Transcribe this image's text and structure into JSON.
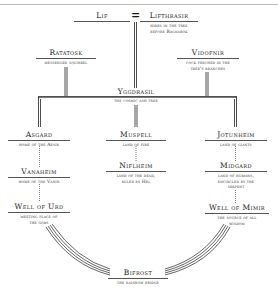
{
  "header": {
    "corner_text": "YGGDRASIL"
  },
  "diagram": {
    "top_pair": {
      "left": {
        "title": "Lif"
      },
      "connector": "=",
      "right": {
        "title": "Lifthrasir",
        "caption": [
          "hides in the tree",
          "before Ragnarok"
        ]
      }
    },
    "ratatosk": {
      "title": "Ratatosk",
      "caption": [
        "messenger squirrel"
      ]
    },
    "vidofnir": {
      "title": "Vidofnir",
      "caption": [
        "cock perched in the",
        "tree's branches"
      ]
    },
    "yggdrasil": {
      "title": "Yggdrasil",
      "caption": [
        "the cosmic ash tree"
      ]
    },
    "asgard": {
      "title": "Asgard",
      "caption": [
        "home of the Aesir"
      ]
    },
    "vanaheim": {
      "title": "Vanaheim",
      "caption": [
        "home of the Vanir"
      ]
    },
    "well_of_urd": {
      "title": "Well of Urd",
      "caption": [
        "meeting place of",
        "the gods"
      ]
    },
    "muspell": {
      "title": "Muspell",
      "caption": [
        "land of fire"
      ]
    },
    "niflheim": {
      "title": "Niflheim",
      "caption": [
        "land of the dead,",
        "ruled by Hel"
      ]
    },
    "jotunheim": {
      "title": "Jotunheim",
      "caption": [
        "land of giants"
      ]
    },
    "midgard": {
      "title": "Midgard",
      "caption": [
        "land of humans,",
        "encircled by the",
        "serpent"
      ]
    },
    "well_of_mimir": {
      "title": "Well of Mimir",
      "caption": [
        "the source of all",
        "wisdom"
      ]
    },
    "bifrost": {
      "title": "Bifrost",
      "caption": [
        "the rainbow bridge"
      ]
    }
  }
}
